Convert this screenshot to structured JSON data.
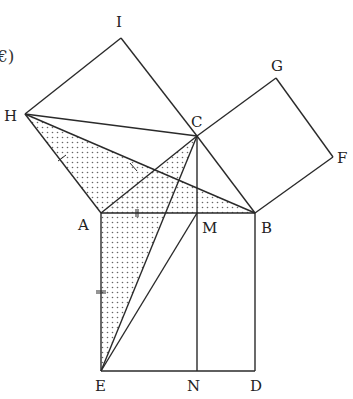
{
  "diagram": {
    "title_fragment": "€)",
    "points": {
      "A": {
        "label": "A",
        "x": 101,
        "y": 213,
        "lx": 78,
        "ly": 230
      },
      "B": {
        "label": "B",
        "x": 255,
        "y": 213,
        "lx": 261,
        "ly": 233
      },
      "C": {
        "label": "C",
        "x": 197,
        "y": 136,
        "lx": 191,
        "ly": 127
      },
      "D": {
        "label": "D",
        "x": 255,
        "y": 371,
        "lx": 250,
        "ly": 391
      },
      "E": {
        "label": "E",
        "x": 101,
        "y": 371,
        "lx": 95,
        "ly": 391
      },
      "F": {
        "label": "F",
        "x": 333,
        "y": 157,
        "lx": 337,
        "ly": 163
      },
      "G": {
        "label": "G",
        "x": 276,
        "y": 78,
        "lx": 271,
        "ly": 71
      },
      "H": {
        "label": "H",
        "x": 25,
        "y": 114,
        "lx": 4,
        "ly": 121
      },
      "I": {
        "label": "I",
        "x": 121,
        "y": 38,
        "lx": 116,
        "ly": 27
      },
      "M": {
        "label": "M",
        "x": 197,
        "y": 213,
        "lx": 202,
        "ly": 233
      },
      "N": {
        "label": "N",
        "x": 197,
        "y": 371,
        "lx": 187,
        "ly": 391
      }
    },
    "shaded_regions": [
      [
        "H",
        "A",
        "B"
      ],
      [
        "A",
        "C",
        "E"
      ]
    ],
    "segments": [
      [
        "A",
        "B"
      ],
      [
        "B",
        "D"
      ],
      [
        "D",
        "E"
      ],
      [
        "E",
        "A"
      ],
      [
        "A",
        "C"
      ],
      [
        "C",
        "B"
      ],
      [
        "C",
        "G"
      ],
      [
        "G",
        "F"
      ],
      [
        "F",
        "B"
      ],
      [
        "A",
        "H"
      ],
      [
        "H",
        "I"
      ],
      [
        "I",
        "C"
      ],
      [
        "H",
        "C"
      ],
      [
        "H",
        "B"
      ],
      [
        "C",
        "N"
      ],
      [
        "E",
        "C"
      ],
      [
        "E",
        "M"
      ]
    ],
    "fill_color": "#ffffff",
    "line_color": "#2a2a2a",
    "dot_color": "#666666"
  }
}
